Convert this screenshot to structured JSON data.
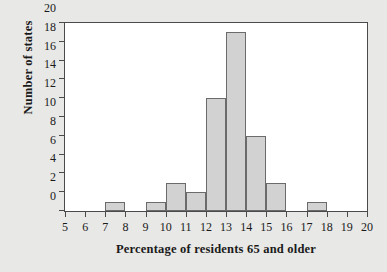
{
  "chart_data": {
    "type": "bar",
    "title": "",
    "xlabel": "Percentage of residents 65 and older",
    "ylabel": "Number of states",
    "xlim": [
      5,
      20
    ],
    "ylim": [
      0,
      20
    ],
    "grid": false,
    "legend": null,
    "bin_width": 1,
    "xticks": [
      5,
      6,
      7,
      8,
      9,
      10,
      11,
      12,
      13,
      14,
      15,
      16,
      17,
      18,
      19,
      20
    ],
    "yticks": [
      0,
      2,
      4,
      6,
      8,
      10,
      12,
      14,
      16,
      18,
      20
    ],
    "bar_fill_color": "#d2d2d2",
    "bar_edge_color": "#6b6b6b",
    "background_color": "#e8e8e6",
    "plot_background_color": "#ffffff",
    "categories": [
      "5-6",
      "6-7",
      "7-8",
      "8-9",
      "9-10",
      "10-11",
      "11-12",
      "12-13",
      "13-14",
      "14-15",
      "15-16",
      "16-17",
      "17-18",
      "18-19",
      "19-20"
    ],
    "bins": [
      {
        "start": 5,
        "end": 6,
        "value": 0
      },
      {
        "start": 6,
        "end": 7,
        "value": 0
      },
      {
        "start": 7,
        "end": 8,
        "value": 1
      },
      {
        "start": 8,
        "end": 9,
        "value": 0
      },
      {
        "start": 9,
        "end": 10,
        "value": 1
      },
      {
        "start": 10,
        "end": 11,
        "value": 3
      },
      {
        "start": 11,
        "end": 12,
        "value": 2
      },
      {
        "start": 12,
        "end": 13,
        "value": 12
      },
      {
        "start": 13,
        "end": 14,
        "value": 19
      },
      {
        "start": 14,
        "end": 15,
        "value": 8
      },
      {
        "start": 15,
        "end": 16,
        "value": 3
      },
      {
        "start": 16,
        "end": 17,
        "value": 0
      },
      {
        "start": 17,
        "end": 18,
        "value": 1
      },
      {
        "start": 18,
        "end": 19,
        "value": 0
      },
      {
        "start": 19,
        "end": 20,
        "value": 0
      }
    ],
    "values": [
      0,
      0,
      1,
      0,
      1,
      3,
      2,
      12,
      19,
      8,
      3,
      0,
      1,
      0,
      0
    ]
  }
}
